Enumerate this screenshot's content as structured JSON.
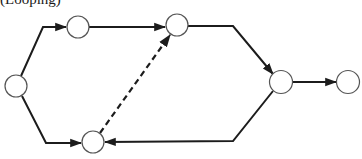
{
  "caption": "(Looping)",
  "colors": {
    "edge": "#1c1c1c",
    "node_stroke": "#555555",
    "background": "#ffffff"
  },
  "nodes": [
    {
      "id": "n1",
      "cx": 16,
      "cy": 86,
      "r": 11
    },
    {
      "id": "n2",
      "cx": 78,
      "cy": 27,
      "r": 11
    },
    {
      "id": "n3",
      "cx": 177,
      "cy": 25,
      "r": 11
    },
    {
      "id": "n4",
      "cx": 93,
      "cy": 142,
      "r": 11
    },
    {
      "id": "n5",
      "cx": 281,
      "cy": 82,
      "r": 11.5
    },
    {
      "id": "n6",
      "cx": 348,
      "cy": 82,
      "r": 11.5
    }
  ],
  "edges": [
    {
      "from": "n1",
      "to": "n2",
      "style": "solid"
    },
    {
      "from": "n1",
      "to": "n4",
      "style": "solid"
    },
    {
      "from": "n2",
      "to": "n3",
      "style": "solid"
    },
    {
      "from": "n4",
      "to": "n3",
      "style": "dashed"
    },
    {
      "from": "n3",
      "to": "n5",
      "style": "solid"
    },
    {
      "from": "n5",
      "to": "n4",
      "style": "solid"
    },
    {
      "from": "n5",
      "to": "n6",
      "style": "solid"
    }
  ]
}
